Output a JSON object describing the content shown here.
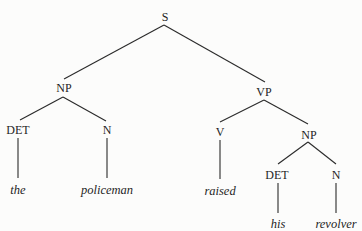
{
  "diagram": {
    "type": "syntax-tree",
    "sentence": "the policeman raised his revolver",
    "colors": {
      "background": "#fcfcfb",
      "line": "#2a2a2a",
      "text": "#1f1f1f"
    },
    "nodes": {
      "s": {
        "label": "S",
        "x": 165,
        "y": 17
      },
      "np_subject": {
        "label": "NP",
        "x": 64,
        "y": 88
      },
      "vp": {
        "label": "VP",
        "x": 264,
        "y": 92
      },
      "det_subject": {
        "label": "DET",
        "x": 18,
        "y": 130
      },
      "n_subject": {
        "label": "N",
        "x": 107,
        "y": 130
      },
      "v": {
        "label": "V",
        "x": 220,
        "y": 132
      },
      "np_object": {
        "label": "NP",
        "x": 309,
        "y": 135
      },
      "det_object": {
        "label": "DET",
        "x": 277,
        "y": 175
      },
      "n_object": {
        "label": "N",
        "x": 336,
        "y": 175
      }
    },
    "leaves": {
      "the": {
        "label": "the",
        "x": 18,
        "y": 190
      },
      "policeman": {
        "label": "policeman",
        "x": 107,
        "y": 190
      },
      "raised": {
        "label": "raised",
        "x": 220,
        "y": 191
      },
      "his": {
        "label": "his",
        "x": 278,
        "y": 224
      },
      "revolver": {
        "label": "revolver",
        "x": 336,
        "y": 224
      }
    },
    "edges": [
      {
        "from": "S",
        "to": "NP",
        "x1": 164,
        "y1": 25,
        "x2": 64,
        "y2": 79
      },
      {
        "from": "S",
        "to": "VP",
        "x1": 164,
        "y1": 25,
        "x2": 265,
        "y2": 82
      },
      {
        "from": "NP",
        "to": "DET",
        "x1": 63,
        "y1": 97,
        "x2": 20,
        "y2": 120
      },
      {
        "from": "NP",
        "to": "N",
        "x1": 63,
        "y1": 97,
        "x2": 106,
        "y2": 121
      },
      {
        "from": "VP",
        "to": "V",
        "x1": 264,
        "y1": 100,
        "x2": 220,
        "y2": 122
      },
      {
        "from": "VP",
        "to": "NP",
        "x1": 264,
        "y1": 100,
        "x2": 308,
        "y2": 124
      },
      {
        "from": "DET",
        "to": "the",
        "x1": 18,
        "y1": 138,
        "x2": 18,
        "y2": 178
      },
      {
        "from": "N",
        "to": "policeman",
        "x1": 107,
        "y1": 138,
        "x2": 107,
        "y2": 178
      },
      {
        "from": "V",
        "to": "raised",
        "x1": 220,
        "y1": 140,
        "x2": 220,
        "y2": 179
      },
      {
        "from": "NP",
        "to": "DET",
        "x1": 308,
        "y1": 142,
        "x2": 278,
        "y2": 164
      },
      {
        "from": "NP",
        "to": "N",
        "x1": 308,
        "y1": 142,
        "x2": 336,
        "y2": 164
      },
      {
        "from": "DET",
        "to": "his",
        "x1": 278,
        "y1": 183,
        "x2": 278,
        "y2": 213
      },
      {
        "from": "N",
        "to": "revolver",
        "x1": 336,
        "y1": 183,
        "x2": 336,
        "y2": 213
      }
    ]
  }
}
